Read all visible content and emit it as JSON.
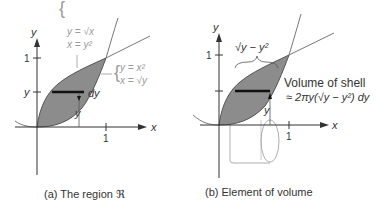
{
  "panel_a": {
    "caption": "(a) The region ℜ",
    "axis_x": "x",
    "axis_y": "y",
    "tick_x1": "1",
    "tick_y1": "1",
    "tick_y": "y",
    "curve_upper": {
      "line1": "y = √x",
      "line2": "x = y²"
    },
    "curve_lower": {
      "line1": "y = x²",
      "line2": "x = √y"
    },
    "strip_label": "dy",
    "height_label": "y"
  },
  "panel_b": {
    "caption": "(b) Element of volume",
    "axis_x": "x",
    "axis_y": "y",
    "tick_x1": "1",
    "tick_y1": "1",
    "width_label": "√y − y²",
    "height_label": "y",
    "volume_title": "Volume of shell",
    "volume_formula": "≈ 2πy(√y − y²) dy"
  },
  "colors": {
    "region_fill": "#8c8c8c",
    "axis": "#333333",
    "curve": "#666666",
    "annotation": "#9a9a9a"
  }
}
